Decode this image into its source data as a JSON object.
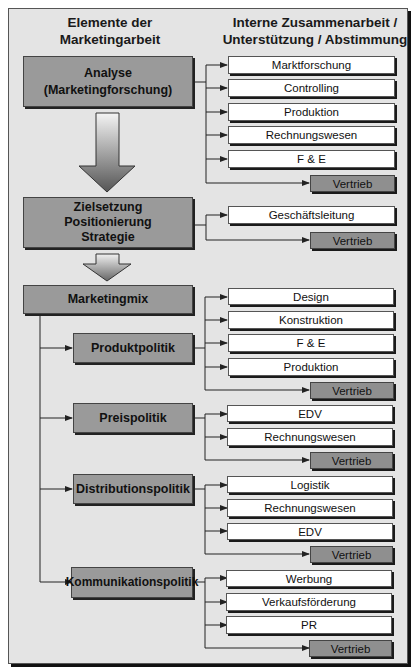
{
  "header": {
    "left_line1": "Elemente der",
    "left_line2": "Marketingarbeit",
    "right_line1": "Interne Zusammenarbeit /",
    "right_line2": "Unterstützung / Abstimmung"
  },
  "colors": {
    "background": "#e4e4e4",
    "main_box": "#9a9a9a",
    "vertrieb_box": "#8f8f8f",
    "sub_box": "#ffffff",
    "lines": "#222222"
  },
  "stages": [
    {
      "label_lines": [
        "Analyse",
        "(Marketingforschung)"
      ],
      "partners": [
        "Marktforschung",
        "Controlling",
        "Produktion",
        "Rechnungswesen",
        "F & E"
      ],
      "vertrieb": "Vertrieb"
    },
    {
      "label_lines": [
        "Zielsetzung",
        "Positionierung",
        "Strategie"
      ],
      "partners": [
        "Geschäftsleitung"
      ],
      "vertrieb": "Vertrieb"
    },
    {
      "label_lines": [
        "Marketingmix"
      ]
    }
  ],
  "mix": [
    {
      "label": "Produktpolitik",
      "partners": [
        "Design",
        "Konstruktion",
        "F & E",
        "Produktion"
      ],
      "vertrieb": "Vertrieb"
    },
    {
      "label": "Preispolitik",
      "partners": [
        "EDV",
        "Rechnungswesen"
      ],
      "vertrieb": "Vertrieb"
    },
    {
      "label": "Distributionspolitik",
      "partners": [
        "Logistik",
        "Rechnungswesen",
        "EDV"
      ],
      "vertrieb": "Vertrieb"
    },
    {
      "label": "Kommunikationspolitik",
      "partners": [
        "Werbung",
        "Verkaufsförderung",
        "PR"
      ],
      "vertrieb": "Vertrieb"
    }
  ]
}
